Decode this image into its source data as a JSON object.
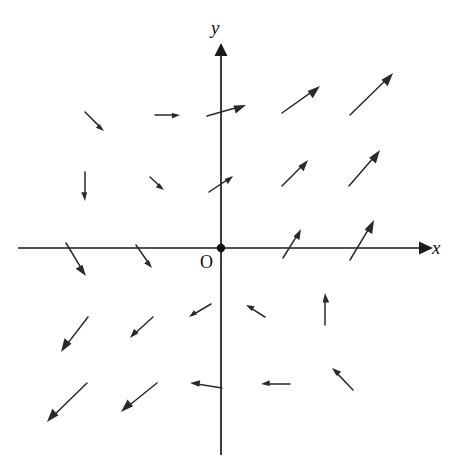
{
  "figure": {
    "type": "vector-field-diagram",
    "background_color": "#ffffff",
    "ink_color": "#2a2a2a"
  },
  "labels": {
    "x_axis": "x",
    "y_axis": "y",
    "origin": "O"
  },
  "chart_data": {
    "type": "scatter",
    "title": "",
    "subtitle": "",
    "xlabel": "x",
    "ylabel": "y",
    "origin_label": "O",
    "grid": false,
    "legend": null,
    "axes": {
      "origin_px": [
        221,
        248
      ],
      "x_axis_px": {
        "x1": 18,
        "y1": 248,
        "x2": 425,
        "y2": 248,
        "arrow_at": "end"
      },
      "y_axis_px": {
        "x1": 221,
        "y1": 455,
        "x2": 221,
        "y2": 48,
        "arrow_at": "end"
      },
      "xlim": [
        -4,
        4
      ],
      "ylim": [
        -4,
        4
      ],
      "tick_labels": []
    },
    "arrows": [
      {
        "id": "a1",
        "quadrant": "II",
        "x1": 85,
        "y1": 112,
        "x2": 104,
        "y2": 131,
        "angle_deg": -45,
        "length_px": 27
      },
      {
        "id": "a2",
        "quadrant": "II",
        "x1": 155,
        "y1": 115,
        "x2": 180,
        "y2": 115,
        "angle_deg": 0,
        "length_px": 25
      },
      {
        "id": "a3",
        "quadrant": "I",
        "x1": 207,
        "y1": 116,
        "x2": 246,
        "y2": 105,
        "angle_deg": 16,
        "length_px": 40
      },
      {
        "id": "a4",
        "quadrant": "I",
        "x1": 282,
        "y1": 113,
        "x2": 320,
        "y2": 86,
        "angle_deg": 35,
        "length_px": 47
      },
      {
        "id": "a5",
        "quadrant": "I",
        "x1": 350,
        "y1": 115,
        "x2": 393,
        "y2": 73,
        "angle_deg": 44,
        "length_px": 60
      },
      {
        "id": "a6",
        "quadrant": "II",
        "x1": 85,
        "y1": 172,
        "x2": 85,
        "y2": 201,
        "angle_deg": -90,
        "length_px": 29
      },
      {
        "id": "a7",
        "quadrant": "II",
        "x1": 150,
        "y1": 177,
        "x2": 164,
        "y2": 190,
        "angle_deg": -43,
        "length_px": 19
      },
      {
        "id": "a8",
        "quadrant": "I",
        "x1": 209,
        "y1": 192,
        "x2": 233,
        "y2": 176,
        "angle_deg": 34,
        "length_px": 29
      },
      {
        "id": "a9",
        "quadrant": "I",
        "x1": 282,
        "y1": 186,
        "x2": 308,
        "y2": 160,
        "angle_deg": 45,
        "length_px": 37
      },
      {
        "id": "a10",
        "quadrant": "I",
        "x1": 349,
        "y1": 186,
        "x2": 380,
        "y2": 150,
        "angle_deg": 49,
        "length_px": 47
      },
      {
        "id": "a11",
        "quadrant": "I",
        "x1": 283,
        "y1": 258,
        "x2": 301,
        "y2": 229,
        "angle_deg": 58,
        "length_px": 34
      },
      {
        "id": "a12",
        "quadrant": "I",
        "x1": 350,
        "y1": 260,
        "x2": 374,
        "y2": 220,
        "angle_deg": 59,
        "length_px": 47
      },
      {
        "id": "a13",
        "quadrant": "III",
        "x1": 66,
        "y1": 243,
        "x2": 86,
        "y2": 276,
        "angle_deg": -59,
        "length_px": 39
      },
      {
        "id": "a14",
        "quadrant": "III",
        "x1": 136,
        "y1": 245,
        "x2": 152,
        "y2": 268,
        "angle_deg": -55,
        "length_px": 28
      },
      {
        "id": "a15",
        "quadrant": "IV",
        "x1": 211,
        "y1": 304,
        "x2": 189,
        "y2": 317,
        "angle_deg": -150,
        "length_px": 26
      },
      {
        "id": "a16",
        "quadrant": "IV",
        "x1": 265,
        "y1": 317,
        "x2": 246,
        "y2": 305,
        "angle_deg": 148,
        "length_px": 23
      },
      {
        "id": "a17",
        "quadrant": "IV",
        "x1": 325,
        "y1": 325,
        "x2": 325,
        "y2": 293,
        "angle_deg": 90,
        "length_px": 32
      },
      {
        "id": "a18",
        "quadrant": "III",
        "x1": 88,
        "y1": 317,
        "x2": 61,
        "y2": 352,
        "angle_deg": -128,
        "length_px": 44
      },
      {
        "id": "a19",
        "quadrant": "III",
        "x1": 153,
        "y1": 317,
        "x2": 130,
        "y2": 338,
        "angle_deg": -137,
        "length_px": 31
      },
      {
        "id": "a20",
        "quadrant": "III",
        "x1": 87,
        "y1": 383,
        "x2": 47,
        "y2": 422,
        "angle_deg": -136,
        "length_px": 56
      },
      {
        "id": "a21",
        "quadrant": "III",
        "x1": 157,
        "y1": 383,
        "x2": 121,
        "y2": 412,
        "angle_deg": -141,
        "length_px": 46
      },
      {
        "id": "a22",
        "quadrant": "IV",
        "x1": 222,
        "y1": 388,
        "x2": 190,
        "y2": 383,
        "angle_deg": 171,
        "length_px": 32
      },
      {
        "id": "a23",
        "quadrant": "IV",
        "x1": 290,
        "y1": 384,
        "x2": 261,
        "y2": 384,
        "angle_deg": 180,
        "length_px": 29
      },
      {
        "id": "a24",
        "quadrant": "IV",
        "x1": 353,
        "y1": 390,
        "x2": 332,
        "y2": 368,
        "angle_deg": 134,
        "length_px": 30
      }
    ]
  }
}
